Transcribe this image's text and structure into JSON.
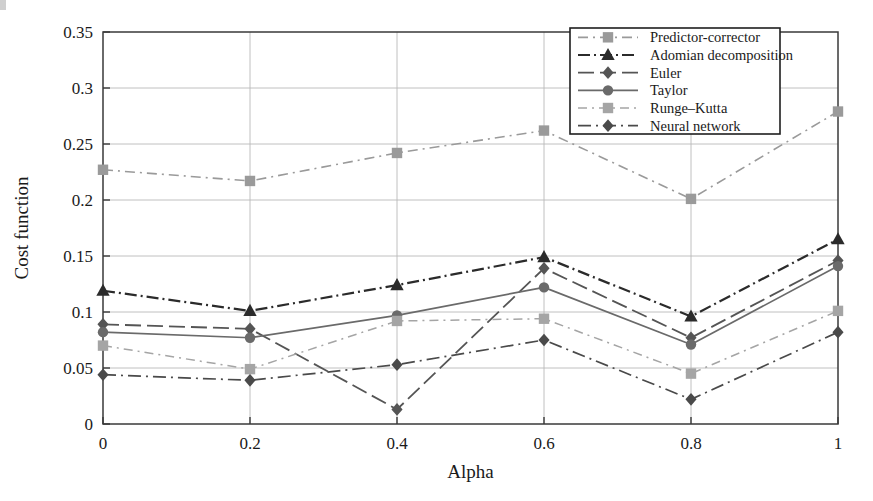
{
  "chart_data": {
    "type": "line",
    "title": "",
    "xlabel": "Alpha",
    "ylabel": "Cost function",
    "x": [
      0,
      0.2,
      0.4,
      0.6,
      0.8,
      1
    ],
    "xtick_labels": [
      "0",
      "0.2",
      "0.4",
      "0.6",
      "0.8",
      "1"
    ],
    "ytick_labels": [
      "0",
      "0.05",
      "0.1",
      "0.15",
      "0.2",
      "0.25",
      "0.3",
      "0.35"
    ],
    "ytick_values": [
      0,
      0.05,
      0.1,
      0.15,
      0.2,
      0.25,
      0.3,
      0.35
    ],
    "xlim": [
      0,
      1
    ],
    "ylim": [
      0,
      0.35
    ],
    "grid": "horizontal-and-vertical",
    "legend_position": "top-right",
    "series": [
      {
        "name": "Predictor-corrector",
        "values": [
          0.227,
          0.217,
          0.242,
          0.262,
          0.201,
          0.279
        ],
        "color": "#9a9a9a",
        "marker": "square",
        "dash": "10,5,2,5",
        "width": 1.6
      },
      {
        "name": "Adomian decomposition",
        "values": [
          0.119,
          0.101,
          0.124,
          0.149,
          0.096,
          0.165
        ],
        "color": "#2b2b2b",
        "marker": "triangle",
        "dash": "12,4,2,4",
        "width": 2.2
      },
      {
        "name": "Euler",
        "values": [
          0.089,
          0.085,
          0.013,
          0.139,
          0.077,
          0.146
        ],
        "color": "#555555",
        "marker": "diamond",
        "dash": "16,6",
        "width": 1.8
      },
      {
        "name": "Taylor",
        "values": [
          0.082,
          0.077,
          0.097,
          0.122,
          0.071,
          0.141
        ],
        "color": "#6a6a6a",
        "marker": "circle",
        "dash": "none",
        "width": 1.7
      },
      {
        "name": "Runge–Kutta",
        "values": [
          0.07,
          0.049,
          0.092,
          0.094,
          0.045,
          0.101
        ],
        "color": "#a5a5a5",
        "marker": "square",
        "dash": "9,5,2,5",
        "width": 1.5
      },
      {
        "name": "Neural network",
        "values": [
          0.044,
          0.039,
          0.053,
          0.075,
          0.022,
          0.082
        ],
        "color": "#4a4a4a",
        "marker": "diamond",
        "dash": "13,5,2,5",
        "width": 1.7
      }
    ]
  },
  "legend": {
    "items": [
      "Predictor-corrector",
      "Adomian decomposition",
      "Euler",
      "Taylor",
      "Runge–Kutta",
      "Neural network"
    ]
  }
}
